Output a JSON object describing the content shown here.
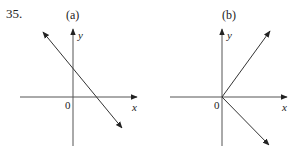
{
  "problem_number": "35.",
  "panels": [
    {
      "id": "a",
      "label": "(a)",
      "x_axis_label": "x",
      "y_axis_label": "y",
      "origin_label": "0",
      "description": "Double-headed line with negative slope, positive y-intercept and positive x-intercept"
    },
    {
      "id": "b",
      "label": "(b)",
      "x_axis_label": "x",
      "y_axis_label": "y",
      "origin_label": "0",
      "description": "Two rays from the origin: one toward upper-right, one toward lower-right"
    }
  ],
  "colors": {
    "line": "#333333",
    "axis": "#555555"
  }
}
